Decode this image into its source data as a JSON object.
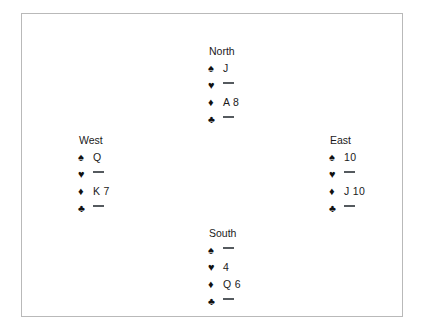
{
  "diagram": {
    "type": "bridge-deal-diagram",
    "suit_symbols": {
      "spades": "♠",
      "hearts": "♥",
      "diamonds": "♦",
      "clubs": "♣"
    },
    "void_marker": "—",
    "colors": {
      "border": "#b9b9b9",
      "background": "#ffffff",
      "text": "#1a1a1a",
      "suit_symbol": "#111111",
      "void_dash": "#555a5e"
    },
    "hands": {
      "north": {
        "label": "North",
        "spades": "J",
        "hearts": "",
        "diamonds": "A 8",
        "clubs": ""
      },
      "west": {
        "label": "West",
        "spades": "Q",
        "hearts": "",
        "diamonds": "K 7",
        "clubs": ""
      },
      "east": {
        "label": "East",
        "spades": "10",
        "hearts": "",
        "diamonds": "J 10",
        "clubs": ""
      },
      "south": {
        "label": "South",
        "spades": "",
        "hearts": "4",
        "diamonds": "Q 6",
        "clubs": ""
      }
    }
  }
}
